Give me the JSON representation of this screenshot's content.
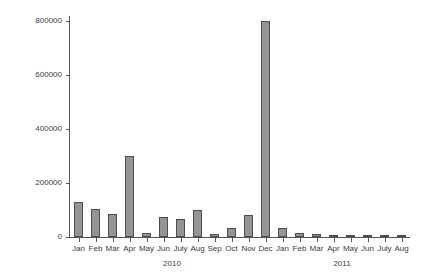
{
  "chart_data": {
    "type": "bar",
    "title": "",
    "subtitle": "",
    "xlabel": "",
    "ylabel": "",
    "grid": false,
    "legend": null,
    "ylim": [
      0,
      800000
    ],
    "yticks": [
      0,
      200000,
      400000,
      600000,
      800000
    ],
    "ytick_labels": [
      "0",
      "200000",
      "400000",
      "600000",
      "800000"
    ],
    "categories": [
      "Jan",
      "Feb",
      "Mar",
      "Apr",
      "May",
      "Jun",
      "July",
      "Aug",
      "Sep",
      "Oct",
      "Nov",
      "Dec",
      "Jan",
      "Feb",
      "Mar",
      "Apr",
      "May",
      "Jun",
      "July",
      "Aug"
    ],
    "values": [
      130000,
      105000,
      85000,
      300000,
      15000,
      75000,
      65000,
      100000,
      12000,
      32000,
      80000,
      800000,
      32000,
      15000,
      10000,
      4000,
      3000,
      9000,
      5000,
      5000
    ],
    "groups": [
      {
        "label": "2010",
        "start_index": 0,
        "end_index": 11
      },
      {
        "label": "2011",
        "start_index": 12,
        "end_index": 19
      }
    ],
    "bar_color": "#949494",
    "bar_edge_color": "#4d4d4d",
    "axis_color": "#555555",
    "background_color": "#ffffff"
  }
}
